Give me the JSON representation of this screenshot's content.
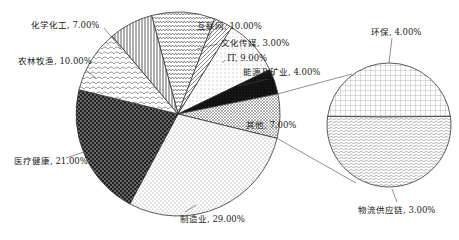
{
  "chart_data": {
    "type": "pie",
    "subtype": "pie-of-pie",
    "title": "",
    "main_pie": {
      "categories": [
        "互联网",
        "文化传媒",
        "IT",
        "能源及矿业",
        "其他",
        "制造业",
        "医疗健康",
        "农林牧渔",
        "化学化工"
      ],
      "values": [
        10.0,
        3.0,
        9.0,
        4.0,
        7.0,
        29.0,
        21.0,
        10.0,
        7.0
      ],
      "labels": [
        "互联网, 10.00%",
        "文化传媒, 3.00%",
        "IT, 9.00%",
        "能源及矿业, 4.00%",
        "其他, 7.00%",
        "制造业, 29.00%",
        "医疗健康, 21.00%",
        "农林牧渔, 10.00%",
        "化学化工, 7.00%"
      ],
      "patterns": [
        "zigzag",
        "diagonal-dash",
        "dots-sparse",
        "solid-dark",
        "cross-hatch-fine",
        "dots-dense",
        "checker-dark",
        "scales",
        "vertical-lines"
      ]
    },
    "secondary_pie": {
      "parent": "其他",
      "categories": [
        "环保",
        "物流供应链"
      ],
      "values": [
        4.0,
        3.0
      ],
      "labels": [
        "环保, 4.00%",
        "物流供应链, 3.00%"
      ],
      "patterns": [
        "grid",
        "wave"
      ]
    },
    "legend": "none",
    "colors": {
      "stroke": "#333333",
      "fill": "#ffffff",
      "dark": "#111111"
    }
  }
}
